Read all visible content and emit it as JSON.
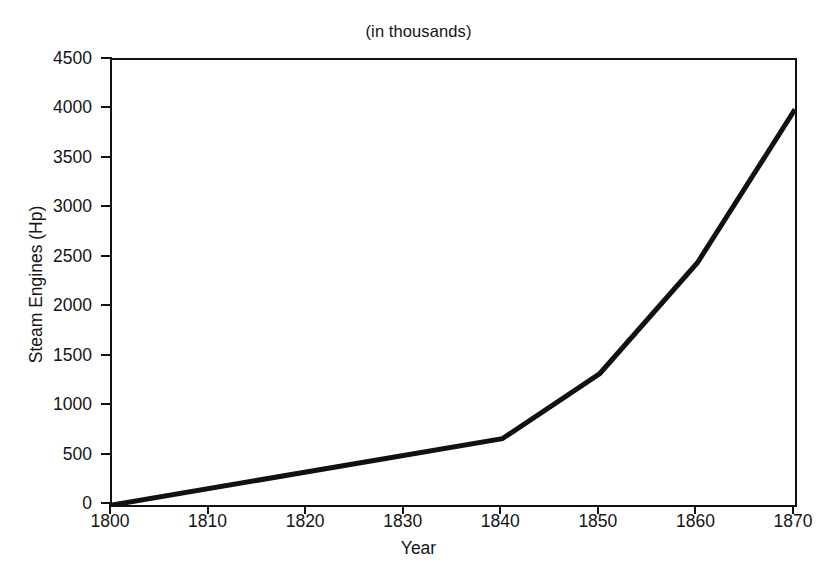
{
  "chart_data": {
    "type": "line",
    "title": "(in thousands)",
    "xlabel": "Year",
    "ylabel": "Steam Engines (Hp)",
    "xlim": [
      1800,
      1870
    ],
    "ylim": [
      0,
      4500
    ],
    "xticks": [
      1800,
      1810,
      1820,
      1830,
      1840,
      1850,
      1860,
      1870
    ],
    "xtick_labels": [
      "1800",
      "1810",
      "1820",
      "1830",
      "1840",
      "1850",
      "1860",
      "1870"
    ],
    "yticks": [
      0,
      500,
      1000,
      1500,
      2000,
      2500,
      3000,
      3500,
      4000,
      4500
    ],
    "ytick_labels": [
      "0",
      "500",
      "1000",
      "1500",
      "2000",
      "2500",
      "3000",
      "3500",
      "4000",
      "4500"
    ],
    "grid": false,
    "legend": false,
    "line_color": "#111111",
    "line_width": 5,
    "series": [
      {
        "name": "Steam Engines (Hp)",
        "x": [
          1800,
          1840,
          1850,
          1860,
          1870
        ],
        "values": [
          0,
          670,
          1330,
          2450,
          4000
        ]
      }
    ]
  },
  "figure": {
    "background_color": "#ffffff",
    "axis_color": "#111111"
  }
}
